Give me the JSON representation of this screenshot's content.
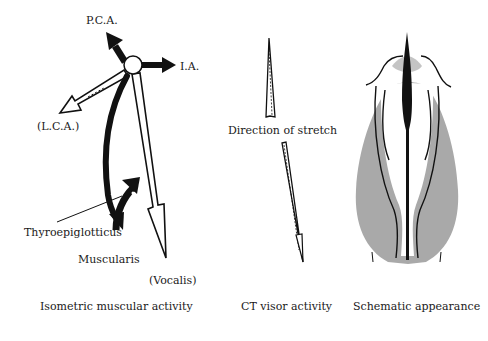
{
  "panels": [
    {
      "caption": "Isometric muscular activity",
      "labels": {
        "pca": "P.C.A.",
        "ia": "I.A.",
        "lca": "(L.C.A.)",
        "thyroepiglotticus": "Thyroepiglotticus",
        "muscularis": "Muscularis",
        "vocalis": "(Vocalis)"
      }
    },
    {
      "caption": "CT visor activity",
      "labels": {
        "direction": "Direction of stretch"
      }
    },
    {
      "caption": "Schematic appearance"
    }
  ],
  "colors": {
    "ink": "#111111",
    "shading": "#9a9a9a",
    "background": "#ffffff"
  }
}
